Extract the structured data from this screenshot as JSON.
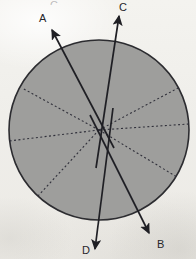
{
  "figure": {
    "background_color": "#f2f1ed",
    "canvas": {
      "width": 196,
      "height": 259
    }
  },
  "circle": {
    "name": "shaded-circle",
    "center_x": 99,
    "center_y": 130,
    "radius": 90,
    "fill_color": "#9e9e9c",
    "stroke_color": "#2c2c30",
    "stroke_width": 1.6
  },
  "dashed_lines": {
    "style": "dashed",
    "color": "#30303a",
    "width": 1.1,
    "dash_pattern": "2,2.4",
    "segments": [
      {
        "name": "dashed-ray-upper-right",
        "angle_deg": 26,
        "x2": 180,
        "y2": 87
      },
      {
        "name": "dashed-ray-right",
        "angle_deg": 4,
        "x2": 189,
        "y2": 124
      },
      {
        "name": "dashed-ray-lower-right",
        "angle_deg": -31,
        "x2": 177,
        "y2": 177
      },
      {
        "name": "dashed-ray-lower-left",
        "angle_deg": -131,
        "x2": 38,
        "y2": 196
      },
      {
        "name": "dashed-ray-left",
        "angle_deg": 186,
        "x2": 9,
        "y2": 141
      },
      {
        "name": "dashed-ray-upper-left",
        "angle_deg": 147,
        "x2": 22,
        "y2": 88
      }
    ]
  },
  "vectors": {
    "color": "#1f1f24",
    "width": 1.7,
    "items": [
      {
        "name": "vector-a",
        "label": "A",
        "tip_x": 52,
        "tip_y": 30,
        "tail_x": 114,
        "tail_y": 148,
        "label_x": 39,
        "label_y": 13,
        "direction": "up-left"
      },
      {
        "name": "vector-c",
        "label": "C",
        "tip_x": 119,
        "tip_y": 16,
        "tail_x": 96,
        "tail_y": 168,
        "label_x": 119,
        "label_y": 2,
        "direction": "up"
      },
      {
        "name": "vector-b",
        "label": "B",
        "tip_x": 149,
        "tip_y": 233,
        "tail_x": 90,
        "tail_y": 115,
        "label_x": 157,
        "label_y": 239,
        "direction": "down-right"
      },
      {
        "name": "vector-d",
        "label": "D",
        "tip_x": 95,
        "tip_y": 249,
        "tail_x": 113,
        "tail_y": 108,
        "label_x": 82,
        "label_y": 245,
        "direction": "down"
      }
    ]
  },
  "artifacts": {
    "ghost_glyph": {
      "name": "cut-off-glyph-remnant",
      "text": "C",
      "x": 50,
      "y": 0
    }
  }
}
